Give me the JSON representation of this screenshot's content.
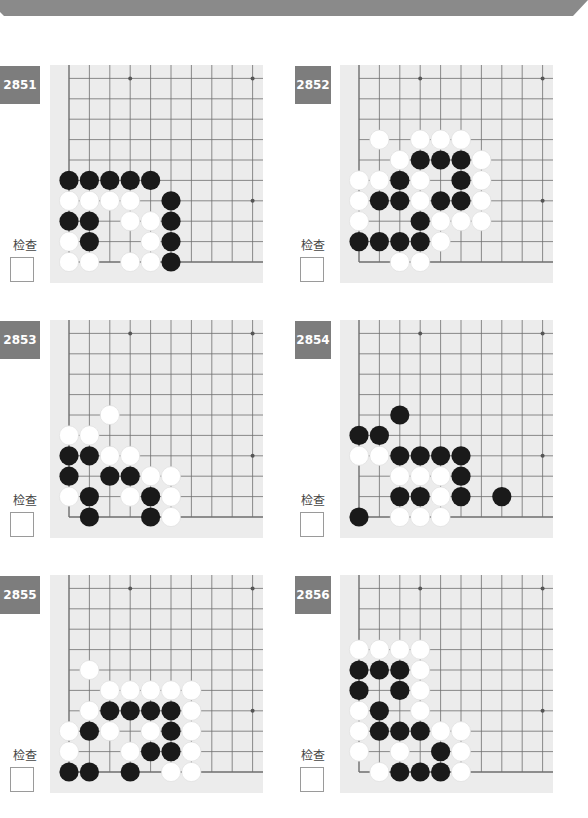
{
  "page": {
    "banner_color": "#8a8a8a",
    "badge_color": "#7d7d7d",
    "board_bg": "#ececec",
    "line_color": "#6e6e6e",
    "black_stone": "#1a1a1a",
    "white_stone": "#ffffff"
  },
  "grid": {
    "origin_x": 19,
    "spacing": 20.4,
    "bottom_y": 197,
    "columns": 10,
    "rows": 11,
    "star_points": [
      [
        3,
        9
      ],
      [
        9,
        9
      ],
      [
        9,
        3
      ]
    ]
  },
  "problems": [
    {
      "number": "2851",
      "check_label": "检查",
      "checked": false,
      "stones": {
        "black": [
          [
            0,
            4
          ],
          [
            1,
            4
          ],
          [
            2,
            4
          ],
          [
            3,
            4
          ],
          [
            4,
            4
          ],
          [
            5,
            3
          ],
          [
            0,
            2
          ],
          [
            1,
            2
          ],
          [
            5,
            2
          ],
          [
            1,
            1
          ],
          [
            5,
            1
          ],
          [
            5,
            0
          ]
        ],
        "white": [
          [
            0,
            3
          ],
          [
            1,
            3
          ],
          [
            2,
            3
          ],
          [
            3,
            3
          ],
          [
            3,
            2
          ],
          [
            4,
            2
          ],
          [
            0,
            1
          ],
          [
            4,
            1
          ],
          [
            0,
            0
          ],
          [
            1,
            0
          ],
          [
            3,
            0
          ],
          [
            4,
            0
          ]
        ]
      }
    },
    {
      "number": "2852",
      "check_label": "检查",
      "checked": false,
      "stones": {
        "black": [
          [
            3,
            5
          ],
          [
            4,
            5
          ],
          [
            5,
            5
          ],
          [
            2,
            4
          ],
          [
            5,
            4
          ],
          [
            1,
            3
          ],
          [
            2,
            3
          ],
          [
            4,
            3
          ],
          [
            5,
            3
          ],
          [
            3,
            2
          ],
          [
            0,
            1
          ],
          [
            1,
            1
          ],
          [
            2,
            1
          ],
          [
            3,
            1
          ]
        ],
        "white": [
          [
            1,
            6
          ],
          [
            3,
            6
          ],
          [
            4,
            6
          ],
          [
            5,
            6
          ],
          [
            2,
            5
          ],
          [
            6,
            5
          ],
          [
            0,
            4
          ],
          [
            1,
            4
          ],
          [
            3,
            4
          ],
          [
            6,
            4
          ],
          [
            0,
            3
          ],
          [
            3,
            3
          ],
          [
            6,
            3
          ],
          [
            0,
            2
          ],
          [
            4,
            2
          ],
          [
            5,
            2
          ],
          [
            6,
            2
          ],
          [
            4,
            1
          ],
          [
            2,
            0
          ],
          [
            3,
            0
          ]
        ]
      }
    },
    {
      "number": "2853",
      "check_label": "检查",
      "checked": false,
      "stones": {
        "black": [
          [
            0,
            3
          ],
          [
            1,
            3
          ],
          [
            0,
            2
          ],
          [
            2,
            2
          ],
          [
            3,
            2
          ],
          [
            1,
            1
          ],
          [
            4,
            1
          ],
          [
            1,
            0
          ],
          [
            4,
            0
          ]
        ],
        "white": [
          [
            2,
            5
          ],
          [
            0,
            4
          ],
          [
            1,
            4
          ],
          [
            2,
            3
          ],
          [
            3,
            3
          ],
          [
            4,
            2
          ],
          [
            5,
            2
          ],
          [
            0,
            1
          ],
          [
            3,
            1
          ],
          [
            5,
            1
          ],
          [
            5,
            0
          ]
        ]
      }
    },
    {
      "number": "2854",
      "check_label": "检查",
      "checked": false,
      "stones": {
        "black": [
          [
            2,
            5
          ],
          [
            0,
            4
          ],
          [
            1,
            4
          ],
          [
            2,
            3
          ],
          [
            3,
            3
          ],
          [
            4,
            3
          ],
          [
            5,
            3
          ],
          [
            5,
            2
          ],
          [
            2,
            1
          ],
          [
            3,
            1
          ],
          [
            5,
            1
          ],
          [
            7,
            1
          ],
          [
            0,
            0
          ]
        ],
        "white": [
          [
            0,
            3
          ],
          [
            1,
            3
          ],
          [
            2,
            2
          ],
          [
            3,
            2
          ],
          [
            4,
            2
          ],
          [
            4,
            1
          ],
          [
            2,
            0
          ],
          [
            3,
            0
          ],
          [
            4,
            0
          ]
        ]
      }
    },
    {
      "number": "2855",
      "check_label": "检查",
      "checked": false,
      "stones": {
        "black": [
          [
            2,
            3
          ],
          [
            3,
            3
          ],
          [
            4,
            3
          ],
          [
            5,
            3
          ],
          [
            1,
            2
          ],
          [
            5,
            2
          ],
          [
            4,
            1
          ],
          [
            5,
            1
          ],
          [
            0,
            0
          ],
          [
            1,
            0
          ],
          [
            3,
            0
          ]
        ],
        "white": [
          [
            1,
            5
          ],
          [
            2,
            4
          ],
          [
            3,
            4
          ],
          [
            4,
            4
          ],
          [
            5,
            4
          ],
          [
            6,
            4
          ],
          [
            1,
            3
          ],
          [
            6,
            3
          ],
          [
            0,
            2
          ],
          [
            2,
            2
          ],
          [
            4,
            2
          ],
          [
            6,
            2
          ],
          [
            0,
            1
          ],
          [
            3,
            1
          ],
          [
            6,
            1
          ],
          [
            5,
            0
          ],
          [
            6,
            0
          ]
        ]
      }
    },
    {
      "number": "2856",
      "check_label": "检查",
      "checked": false,
      "stones": {
        "black": [
          [
            0,
            5
          ],
          [
            1,
            5
          ],
          [
            2,
            5
          ],
          [
            0,
            4
          ],
          [
            2,
            4
          ],
          [
            1,
            3
          ],
          [
            1,
            2
          ],
          [
            2,
            2
          ],
          [
            3,
            2
          ],
          [
            4,
            1
          ],
          [
            2,
            0
          ],
          [
            3,
            0
          ],
          [
            4,
            0
          ]
        ],
        "white": [
          [
            0,
            6
          ],
          [
            1,
            6
          ],
          [
            2,
            6
          ],
          [
            3,
            6
          ],
          [
            3,
            5
          ],
          [
            3,
            4
          ],
          [
            0,
            3
          ],
          [
            3,
            3
          ],
          [
            0,
            2
          ],
          [
            4,
            2
          ],
          [
            5,
            2
          ],
          [
            0,
            1
          ],
          [
            2,
            1
          ],
          [
            5,
            1
          ],
          [
            1,
            0
          ],
          [
            5,
            0
          ]
        ]
      }
    }
  ]
}
